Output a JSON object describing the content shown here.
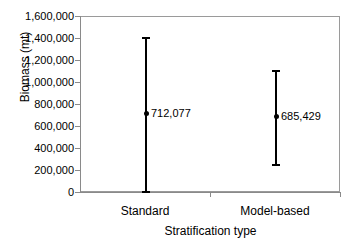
{
  "chart_data": {
    "type": "scatter",
    "title": "",
    "xlabel": "Stratification type",
    "ylabel": "Biomass (mt)",
    "categories": [
      "Standard",
      "Model-based"
    ],
    "values": [
      712077,
      685429
    ],
    "value_labels": [
      "712,077",
      "685,429"
    ],
    "error_low": [
      0,
      245000
    ],
    "error_high": [
      1410000,
      1110000
    ],
    "ylim": [
      0,
      1600000
    ],
    "ytick_values": [
      0,
      200000,
      400000,
      600000,
      800000,
      1000000,
      1200000,
      1400000,
      1600000
    ],
    "ytick_labels": [
      "0",
      "200,000",
      "400,000",
      "600,000",
      "800,000",
      "1,000,000",
      "1,200,000",
      "1,400,000",
      "1,600,000"
    ],
    "grid": false,
    "legend": "none",
    "marker": "filled-circle",
    "series": [
      {
        "name": "Standard",
        "value": 712077,
        "value_label": "712,077",
        "lower": 0,
        "upper": 1410000
      },
      {
        "name": "Model-based",
        "value": 685429,
        "value_label": "685,429",
        "lower": 245000,
        "upper": 1110000
      }
    ],
    "colors": {
      "marker": "#000000",
      "errorbar": "#000000",
      "axis": "#8a8a8a",
      "frame": "#9a9a9a",
      "background": "#ffffff",
      "text": "#000000"
    }
  }
}
